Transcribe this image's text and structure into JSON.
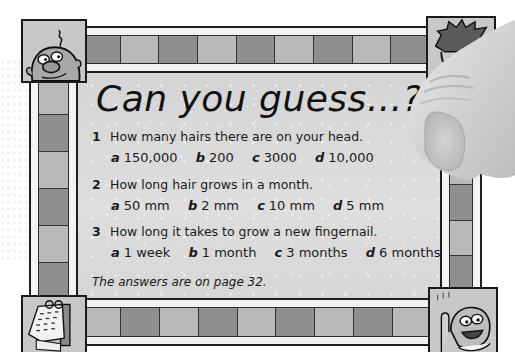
{
  "title": "Can you guess...?",
  "questions": [
    {
      "number": "1",
      "text": "How many hairs there are on your head.",
      "options": [
        {
          "letter": "a",
          "value": "150,000"
        },
        {
          "letter": "b",
          "value": "200"
        },
        {
          "letter": "c",
          "value": "3000"
        },
        {
          "letter": "d",
          "value": "10,000"
        }
      ]
    },
    {
      "number": "2",
      "text": "How long hair grows in a month.",
      "options": [
        {
          "letter": "a",
          "value": "50 mm"
        },
        {
          "letter": "b",
          "value": "2 mm"
        },
        {
          "letter": "c",
          "value": "10 mm"
        },
        {
          "letter": "d",
          "value": "5 mm"
        }
      ]
    },
    {
      "number": "3",
      "text": "How long it takes to grow a new fingernail.",
      "options": [
        {
          "letter": "a",
          "value": "1 week"
        },
        {
          "letter": "b",
          "value": "1 month"
        },
        {
          "letter": "c",
          "value": "3 months"
        },
        {
          "letter": "d",
          "value": "6 months"
        }
      ]
    }
  ],
  "answers_note": "The answers are on page 32.",
  "illustrations": {
    "top_left": "bald-cartoon-face-icon",
    "top_right": "spiky-hair-cartoon-face-icon",
    "bottom_left": "calendar-icon",
    "bottom_right": "smiling-kid-pointing-icon",
    "overlay": "finger-photo"
  },
  "colors": {
    "panel": "#d9d9d9",
    "tile_dark": "#8f8f8f",
    "tile_light": "#b9b9b9",
    "outline": "#1a1a1a",
    "text": "#1a1a1a"
  }
}
